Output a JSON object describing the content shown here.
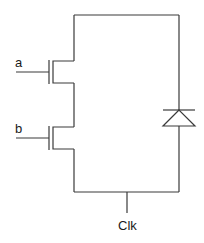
{
  "diagram": {
    "type": "circuit-schematic",
    "labels": {
      "input_a": "a",
      "input_b": "b",
      "clock": "Clk"
    },
    "components": [
      {
        "id": "transistor-a",
        "kind": "nmos-transistor",
        "gate": "a"
      },
      {
        "id": "transistor-b",
        "kind": "nmos-transistor",
        "gate": "b"
      },
      {
        "id": "diode",
        "kind": "diode",
        "orientation": "cathode-up"
      }
    ],
    "colors": {
      "wire": "#3a3a3a",
      "text": "#1a1a1a",
      "background": "#ffffff"
    }
  }
}
